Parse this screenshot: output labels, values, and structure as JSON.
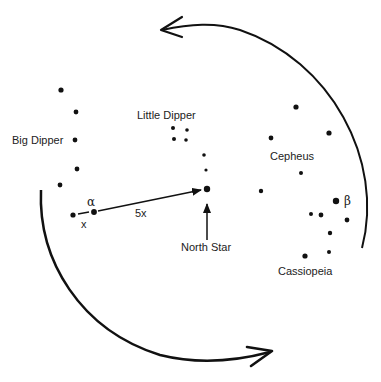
{
  "labels": {
    "big_dipper": "Big Dipper",
    "little_dipper": "Little Dipper",
    "cepheus": "Cepheus",
    "cassiopeia": "Cassiopeia",
    "north_star": "North Star",
    "alpha": "α",
    "beta": "β",
    "x": "x",
    "five_x": "5x"
  },
  "colors": {
    "ink": "#111111",
    "background": "#ffffff"
  }
}
